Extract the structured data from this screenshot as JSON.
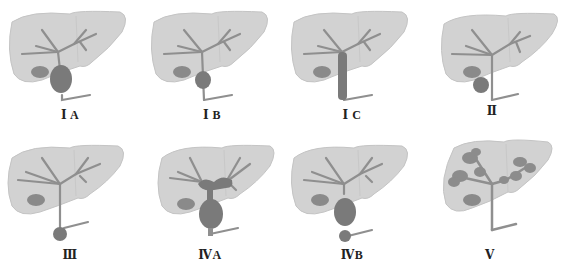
{
  "figure": {
    "title": "",
    "colors": {
      "liver": "#d2d2d2",
      "liver_edge": "#c4c4c4",
      "duct": "#8f8f8f",
      "cyst": "#7a7a7a",
      "gallbladder": "#8a8a8a",
      "label": "#222222"
    },
    "panels": [
      {
        "id": "IA",
        "label": "Ⅰ A",
        "description": "Cystic dilation of common bile duct"
      },
      {
        "id": "IB",
        "label": "Ⅰ B",
        "description": "Focal segmental dilation of common bile duct"
      },
      {
        "id": "IC",
        "label": "Ⅰ C",
        "description": "Fusiform dilation of common bile duct"
      },
      {
        "id": "II",
        "label": "Ⅱ",
        "description": "Diverticulum of extrahepatic duct"
      },
      {
        "id": "III",
        "label": "Ⅲ",
        "description": "Choledochocele at distal duct"
      },
      {
        "id": "IVA",
        "label": "ⅣA",
        "description": "Intra- and extrahepatic cystic dilation"
      },
      {
        "id": "IVB",
        "label": "ⅣB",
        "description": "Multiple extrahepatic cysts"
      },
      {
        "id": "V",
        "label": "Ⅴ",
        "description": "Intrahepatic cystic dilation (Caroli)"
      }
    ]
  }
}
